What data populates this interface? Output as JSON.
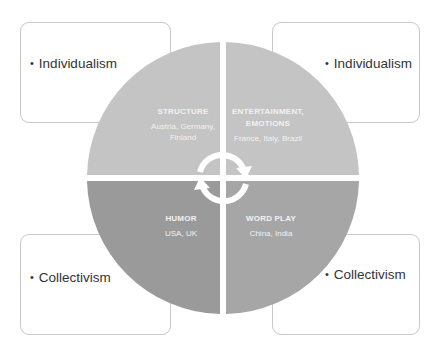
{
  "boxes": {
    "top_left": {
      "text": "Individualism"
    },
    "top_right": {
      "text": "Individualism"
    },
    "bottom_left": {
      "text": "Collectivism"
    },
    "bottom_right": {
      "text": "Collectivism"
    }
  },
  "quadrants": {
    "top_left": {
      "title": "STRUCTURE",
      "countries": "Austria, Germany, Finland",
      "color": "#c4c4c4"
    },
    "top_right": {
      "title": "ENTERTAINMENT, EMOTIONS",
      "countries": "France, Italy, Brazil",
      "color": "#c4c4c4"
    },
    "bottom_left": {
      "title": "HUMOR",
      "countries": "USA, UK",
      "color": "#9a9a9a"
    },
    "bottom_right": {
      "title": "WORD PLAY",
      "countries": "China, India",
      "color": "#a6a6a6"
    }
  },
  "center": {
    "icon": "cycle-arrows-icon"
  }
}
